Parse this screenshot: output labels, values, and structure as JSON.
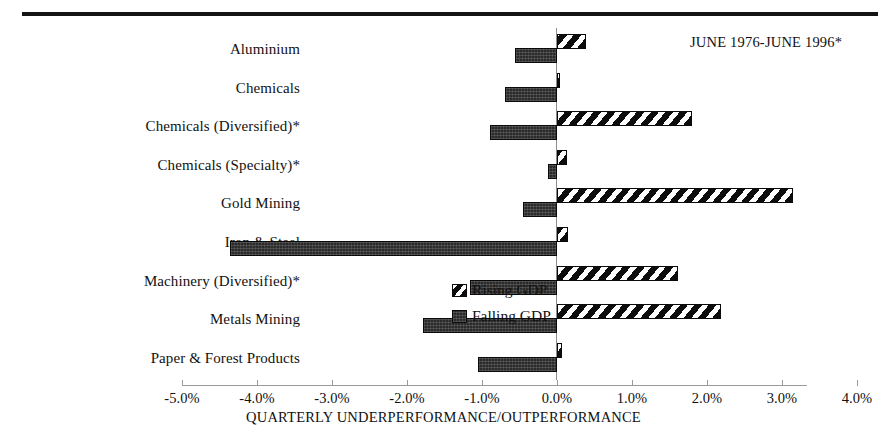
{
  "period_title": "JUNE 1976-JUNE 1996*",
  "legend": {
    "position": "inside-left",
    "items": [
      {
        "label": "Rising GDP",
        "key": "rising",
        "pattern": "diagonal-hatch",
        "color": "#0d0d0d"
      },
      {
        "label": "Falling GDP",
        "key": "falling",
        "pattern": "solid-dark",
        "color": "#2b2b2b"
      }
    ]
  },
  "axis": {
    "title": "QUARTERLY UNDERPERFORMANCE/OUTPERFORMANCE",
    "tick_labels": [
      "-5.0%",
      "-4.0%",
      "-3.0%",
      "-2.0%",
      "-1.0%",
      "0.0%",
      "1.0%",
      "2.0%",
      "3.0%",
      "4.0%"
    ],
    "tick_values": [
      -5.0,
      -4.0,
      -3.0,
      -2.0,
      -1.0,
      0.0,
      1.0,
      2.0,
      3.0,
      4.0
    ]
  },
  "chart_data": {
    "type": "bar",
    "orientation": "horizontal",
    "title": "JUNE 1976-JUNE 1996*",
    "xlabel": "QUARTERLY UNDERPERFORMANCE/OUTPERFORMANCE",
    "ylabel": "",
    "xlim": [
      -5.0,
      4.0
    ],
    "grid": false,
    "legend_position": "inside-left",
    "categories": [
      "Aluminium",
      "Chemicals",
      "Chemicals (Diversified)*",
      "Chemicals (Specialty)*",
      "Gold Mining",
      "Iron & Steel",
      "Machinery (Diversified)*",
      "Metals Mining",
      "Paper & Forest Products"
    ],
    "series": [
      {
        "name": "Rising GDP",
        "values": [
          0.39,
          0.04,
          1.8,
          0.13,
          3.15,
          0.15,
          1.61,
          2.19,
          0.06
        ]
      },
      {
        "name": "Falling GDP",
        "values": [
          -0.56,
          -0.69,
          -0.89,
          -0.12,
          -0.46,
          -4.36,
          -1.16,
          -1.79,
          -1.05
        ]
      }
    ]
  }
}
